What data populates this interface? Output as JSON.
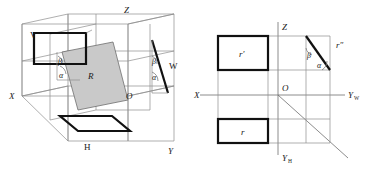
{
  "figure": {
    "panels": [
      {
        "id": "left",
        "name": "three-dimensional-projection-box",
        "labels": {
          "plane_v": "V",
          "plane_h": "H",
          "plane_w": "W",
          "axis_x": "X",
          "axis_y": "Y",
          "axis_z": "Z",
          "origin": "O",
          "plane_r": "R",
          "angle_alpha_front": "α",
          "angle_beta_front": "β",
          "angle_alpha_side": "α",
          "angle_beta_side": "β"
        }
      },
      {
        "id": "right",
        "name": "multiview-orthographic-projection",
        "labels": {
          "axis_x": "X",
          "axis_z": "Z",
          "axis_yw": "Y",
          "axis_yw_sub": "W",
          "axis_yh": "Y",
          "axis_yh_sub": "H",
          "origin": "O",
          "view_front": "r",
          "view_front_prime": "r′",
          "view_side_double_prime": "r″",
          "angle_alpha": "α",
          "angle_beta": "β"
        }
      }
    ],
    "colors": {
      "ink": "#1a1a1a",
      "bold_line": "#111111",
      "thin_line": "#8d8d8d",
      "shade_fill": "#c9c9c9",
      "background": "#ffffff"
    }
  }
}
